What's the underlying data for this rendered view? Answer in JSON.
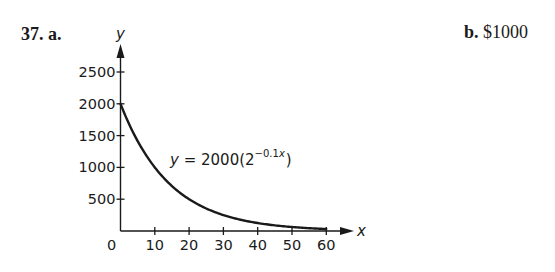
{
  "problem": {
    "number_label": "37. a.",
    "part_b_label": "b.",
    "part_b_answer": "$1000"
  },
  "chart_data": {
    "type": "line",
    "title": "",
    "xlabel": "x",
    "ylabel": "y",
    "xlim": [
      0,
      60
    ],
    "ylim": [
      0,
      2500
    ],
    "x_ticks": [
      10,
      20,
      30,
      40,
      50,
      60
    ],
    "y_ticks": [
      500,
      1000,
      1500,
      2000,
      2500
    ],
    "origin_label": "0",
    "grid": false,
    "legend": null,
    "annotation": {
      "text_prefix": "y = 2000(2",
      "exponent": "−0.1x",
      "text_suffix": ")"
    },
    "series": [
      {
        "name": "y = 2000(2^(-0.1x))",
        "x": [
          0,
          5,
          10,
          15,
          20,
          25,
          30,
          35,
          40,
          45,
          50,
          55,
          60
        ],
        "values": [
          2000,
          1414.2,
          1000,
          707.1,
          500,
          353.6,
          250,
          176.8,
          125,
          88.4,
          62.5,
          44.2,
          31.3
        ]
      }
    ]
  }
}
